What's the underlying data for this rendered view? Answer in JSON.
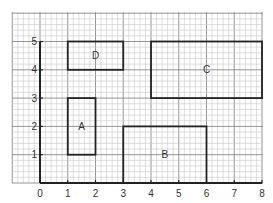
{
  "diagram": {
    "type": "coordinate-grid",
    "x_axis": {
      "ticks": [
        "0",
        "1",
        "2",
        "3",
        "4",
        "5",
        "6",
        "7",
        "8"
      ],
      "min": 0,
      "max": 8
    },
    "y_axis": {
      "ticks": [
        "1",
        "2",
        "3",
        "4",
        "5"
      ],
      "min": 0,
      "max": 5
    },
    "grid": {
      "subdivisions_per_unit": 5,
      "x_extent": [
        -1,
        8
      ],
      "y_extent": [
        0,
        6
      ]
    },
    "rectangles": [
      {
        "label": "A",
        "x1": 1,
        "y1": 1,
        "x2": 2,
        "y2": 3
      },
      {
        "label": "B",
        "x1": 3,
        "y1": 0,
        "x2": 6,
        "y2": 2
      },
      {
        "label": "C",
        "x1": 4,
        "y1": 3,
        "x2": 8,
        "y2": 5
      },
      {
        "label": "D",
        "x1": 1,
        "y1": 4,
        "x2": 3,
        "y2": 5
      }
    ],
    "colors": {
      "grid_minor": "#c8c8c8",
      "grid_major": "#8a8a8a",
      "axis": "#222222",
      "rect": "#222222"
    }
  }
}
